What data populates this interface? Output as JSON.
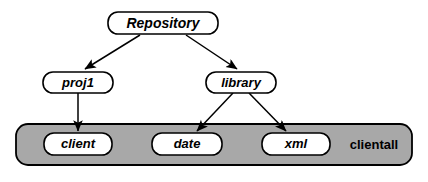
{
  "diagram": {
    "type": "tree-hierarchy",
    "background_color": "#ffffff",
    "nodes": {
      "repository": {
        "label": "Repository",
        "x": 163,
        "y": 23,
        "w": 110,
        "h": 22
      },
      "proj1": {
        "label": "proj1",
        "x": 78,
        "y": 82,
        "w": 70,
        "h": 21
      },
      "library": {
        "label": "library",
        "x": 241,
        "y": 82,
        "w": 70,
        "h": 21
      },
      "client": {
        "label": "client",
        "x": 78,
        "y": 144,
        "w": 68,
        "h": 22
      },
      "date": {
        "label": "date",
        "x": 187,
        "y": 144,
        "w": 70,
        "h": 22
      },
      "xml": {
        "label": "xml",
        "x": 296,
        "y": 144,
        "w": 68,
        "h": 22
      }
    },
    "group": {
      "label": "clientall",
      "x": 16,
      "y": 124,
      "w": 396,
      "h": 41,
      "fill_color": "#a8a8a8",
      "stroke_color": "#000000",
      "label_x": 374,
      "label_y": 145,
      "members": [
        "client",
        "date",
        "xml"
      ]
    },
    "edges": [
      {
        "from": "repository",
        "to": "proj1",
        "x1": 140,
        "y1": 35,
        "x2": 84,
        "y2": 70
      },
      {
        "from": "repository",
        "to": "library",
        "x1": 186,
        "y1": 35,
        "x2": 238,
        "y2": 70
      },
      {
        "from": "proj1",
        "to": "client",
        "x1": 78,
        "y1": 93,
        "x2": 78,
        "y2": 132
      },
      {
        "from": "library",
        "to": "date",
        "x1": 233,
        "y1": 93,
        "x2": 196,
        "y2": 132
      },
      {
        "from": "library",
        "to": "xml",
        "x1": 249,
        "y1": 93,
        "x2": 287,
        "y2": 132
      }
    ],
    "styles": {
      "node_label_style": "bold-italic",
      "group_label_style": "bold-upright",
      "node_label_font_size": 13,
      "group_label_font_size": 13,
      "node_corner_radius": 10,
      "group_corner_radius": 12
    }
  }
}
